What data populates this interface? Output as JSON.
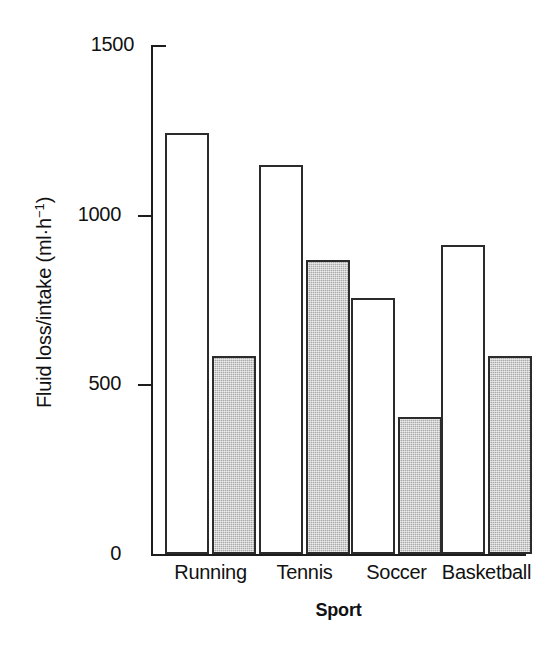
{
  "chart_data": {
    "type": "bar",
    "title": "",
    "xlabel": "Sport",
    "ylabel": "Fluid loss/intake (ml·h⁻¹)",
    "ylabel_main": "Fluid loss/intake (ml·h",
    "ylabel_sup": "−1",
    "ylabel_tail": ")",
    "categories": [
      "Running",
      "Tennis",
      "Soccer",
      "Basketball"
    ],
    "series": [
      {
        "name": "Fluid loss",
        "style": "open",
        "values": [
          1240,
          1145,
          755,
          910
        ]
      },
      {
        "name": "Fluid intake",
        "style": "filled",
        "values": [
          585,
          865,
          405,
          585
        ]
      }
    ],
    "ylim": [
      0,
      1500
    ],
    "yticks": [
      0,
      500,
      1000,
      1500
    ],
    "ytick_labels": [
      "0",
      "500",
      "1000",
      "1500"
    ],
    "grid": false,
    "legend": "none",
    "colors": {
      "axis": "#1d1d1d",
      "bar_outline": "#2b2b2b",
      "open_fill": "#ffffff",
      "filled_fill": "#a9a9a9",
      "text": "#111111",
      "background": "#ffffff"
    }
  }
}
